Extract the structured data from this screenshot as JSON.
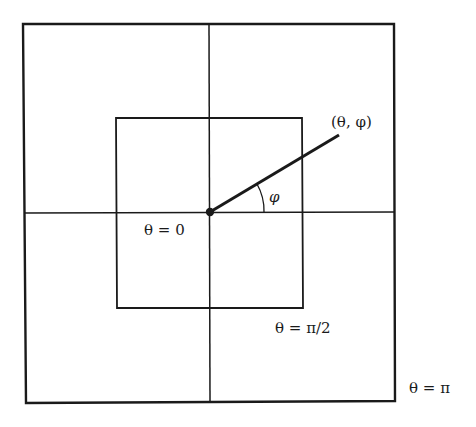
{
  "diagram": {
    "colors": {
      "stroke": "#1a1a1a",
      "background": "#ffffff"
    },
    "outer_square": {
      "label": "θ = π"
    },
    "inner_square": {
      "label": "θ = π/2"
    },
    "center": {
      "label": "θ = 0"
    },
    "point": {
      "label": "(θ, φ)"
    },
    "angle": {
      "label": "φ"
    }
  }
}
